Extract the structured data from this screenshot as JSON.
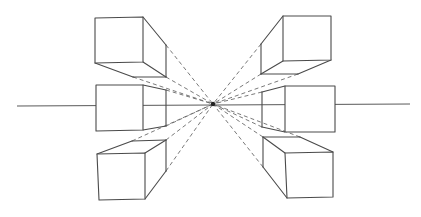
{
  "diagram": {
    "colors": {
      "line": "#4a4a4a",
      "guide": "#6a6a6a",
      "background": "#ffffff"
    },
    "horizon": {
      "x1": 17,
      "y1": 106,
      "x2": 410,
      "y2": 104
    },
    "vanishing_point": {
      "x": 213,
      "y": 104
    },
    "boxes": [
      {
        "id": "top-left",
        "front": [
          [
            95,
            18
          ],
          [
            143,
            17
          ],
          [
            143,
            62
          ],
          [
            95,
            63
          ]
        ],
        "back": [
          [
            166,
            45
          ],
          [
            166,
            77
          ],
          [
            133,
            77
          ]
        ],
        "edges": [
          [
            [
              143,
              17
            ],
            [
              166,
              45
            ]
          ],
          [
            [
              166,
              45
            ],
            [
              166,
              77
            ]
          ],
          [
            [
              143,
              62
            ],
            [
              166,
              77
            ]
          ],
          [
            [
              95,
              63
            ],
            [
              133,
              77
            ]
          ],
          [
            [
              133,
              77
            ],
            [
              166,
              77
            ]
          ]
        ]
      },
      {
        "id": "middle-left",
        "front": [
          [
            96,
            85
          ],
          [
            143,
            85
          ],
          [
            143,
            130
          ],
          [
            96,
            131
          ]
        ],
        "edges": [
          [
            [
              143,
              85
            ],
            [
              166,
              90
            ]
          ],
          [
            [
              166,
              90
            ],
            [
              166,
              126
            ]
          ],
          [
            [
              143,
              130
            ],
            [
              166,
              126
            ]
          ]
        ]
      },
      {
        "id": "bottom-left",
        "front": [
          [
            97,
            154
          ],
          [
            145,
            153
          ],
          [
            145,
            199
          ],
          [
            99,
            200
          ]
        ],
        "edges": [
          [
            [
              97,
              154
            ],
            [
              132,
              141
            ]
          ],
          [
            [
              132,
              141
            ],
            [
              166,
              140
            ]
          ],
          [
            [
              145,
              153
            ],
            [
              166,
              140
            ]
          ],
          [
            [
              166,
              140
            ],
            [
              166,
              171
            ]
          ],
          [
            [
              145,
              199
            ],
            [
              166,
              171
            ]
          ]
        ]
      },
      {
        "id": "top-right",
        "front": [
          [
            283,
            16
          ],
          [
            331,
            16
          ],
          [
            331,
            60
          ],
          [
            283,
            61
          ]
        ],
        "edges": [
          [
            [
              283,
              16
            ],
            [
              261,
              44
            ]
          ],
          [
            [
              261,
              44
            ],
            [
              261,
              74
            ]
          ],
          [
            [
              283,
              61
            ],
            [
              261,
              74
            ]
          ],
          [
            [
              261,
              74
            ],
            [
              298,
              74
            ]
          ],
          [
            [
              298,
              74
            ],
            [
              331,
              60
            ]
          ]
        ]
      },
      {
        "id": "middle-right",
        "front": [
          [
            285,
            86
          ],
          [
            335,
            86
          ],
          [
            335,
            132
          ],
          [
            285,
            132
          ]
        ],
        "edges": [
          [
            [
              285,
              86
            ],
            [
              262,
              92
            ]
          ],
          [
            [
              262,
              92
            ],
            [
              262,
              127
            ]
          ],
          [
            [
              262,
              127
            ],
            [
              285,
              132
            ]
          ]
        ]
      },
      {
        "id": "bottom-right",
        "front": [
          [
            285,
            153
          ],
          [
            333,
            152
          ],
          [
            333,
            197
          ],
          [
            287,
            198
          ]
        ],
        "edges": [
          [
            [
              285,
              153
            ],
            [
              263,
              137
            ]
          ],
          [
            [
              263,
              137
            ],
            [
              300,
              137
            ]
          ],
          [
            [
              300,
              137
            ],
            [
              333,
              152
            ]
          ],
          [
            [
              263,
              137
            ],
            [
              263,
              167
            ]
          ],
          [
            [
              263,
              167
            ],
            [
              287,
              198
            ]
          ]
        ]
      }
    ],
    "guides": [
      [
        [
          166,
          45
        ],
        [
          213,
          104
        ]
      ],
      [
        [
          166,
          77
        ],
        [
          213,
          104
        ]
      ],
      [
        [
          133,
          77
        ],
        [
          213,
          104
        ]
      ],
      [
        [
          166,
          90
        ],
        [
          213,
          104
        ]
      ],
      [
        [
          166,
          126
        ],
        [
          213,
          104
        ]
      ],
      [
        [
          166,
          140
        ],
        [
          213,
          104
        ]
      ],
      [
        [
          166,
          171
        ],
        [
          213,
          104
        ]
      ],
      [
        [
          132,
          141
        ],
        [
          213,
          104
        ]
      ],
      [
        [
          261,
          44
        ],
        [
          213,
          104
        ]
      ],
      [
        [
          261,
          74
        ],
        [
          213,
          104
        ]
      ],
      [
        [
          298,
          74
        ],
        [
          213,
          104
        ]
      ],
      [
        [
          262,
          92
        ],
        [
          213,
          104
        ]
      ],
      [
        [
          262,
          127
        ],
        [
          213,
          104
        ]
      ],
      [
        [
          263,
          137
        ],
        [
          213,
          104
        ]
      ],
      [
        [
          263,
          167
        ],
        [
          213,
          104
        ]
      ],
      [
        [
          300,
          137
        ],
        [
          213,
          104
        ]
      ]
    ]
  }
}
